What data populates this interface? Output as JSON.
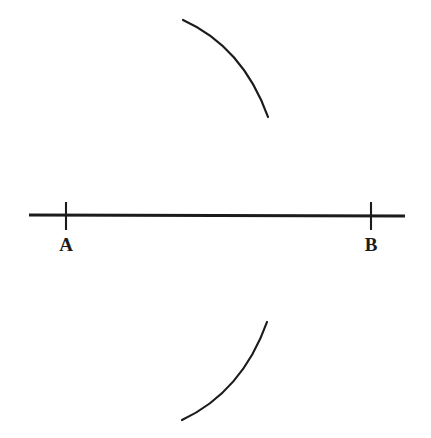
{
  "figure": {
    "background_color": "#ffffff",
    "ink_color": "#1b1b1b",
    "width": 431,
    "height": 438
  },
  "labels": {
    "point_a": "A",
    "point_b": "B"
  },
  "geometry": {
    "baseline": {
      "name": "line-AB",
      "x1": 29,
      "y1": 215,
      "x2": 405,
      "y2": 216,
      "stroke_width": 3.2
    },
    "ticks": [
      {
        "name": "tick-a",
        "x": 66,
        "y_top": 202,
        "y_bottom": 230,
        "stroke_width": 2.1
      },
      {
        "name": "tick-b",
        "x": 371,
        "y_top": 202,
        "y_bottom": 230,
        "stroke_width": 2.1
      }
    ],
    "arcs": [
      {
        "name": "arc-upper",
        "start_x": 183,
        "start_y": 20,
        "end_x": 268,
        "end_y": 117,
        "control_x": 243,
        "control_y": 47,
        "stroke_width": 2.2
      },
      {
        "name": "arc-lower",
        "start_x": 182,
        "start_y": 420,
        "end_x": 267,
        "end_y": 322,
        "control_x": 242,
        "control_y": 392,
        "stroke_width": 2.2
      }
    ],
    "label_positions": {
      "a": {
        "x": 66,
        "y": 248
      },
      "b": {
        "x": 371,
        "y": 248
      }
    }
  }
}
